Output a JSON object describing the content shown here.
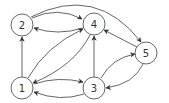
{
  "diagram": {
    "type": "directed-graph",
    "nodes": [
      {
        "id": "1",
        "label": "1",
        "x": 22,
        "y": 88
      },
      {
        "id": "2",
        "label": "2",
        "x": 22,
        "y": 25
      },
      {
        "id": "3",
        "label": "3",
        "x": 94,
        "y": 88
      },
      {
        "id": "4",
        "label": "4",
        "x": 94,
        "y": 24
      },
      {
        "id": "5",
        "label": "5",
        "x": 146,
        "y": 53
      }
    ],
    "edges": [
      {
        "from": "1",
        "to": "2"
      },
      {
        "from": "2",
        "to": "4"
      },
      {
        "from": "4",
        "to": "2"
      },
      {
        "from": "2",
        "to": "5"
      },
      {
        "from": "1",
        "to": "4"
      },
      {
        "from": "4",
        "to": "1"
      },
      {
        "from": "3",
        "to": "4"
      },
      {
        "from": "5",
        "to": "4"
      },
      {
        "from": "3",
        "to": "5"
      },
      {
        "from": "5",
        "to": "3"
      },
      {
        "from": "1",
        "to": "3"
      },
      {
        "from": "3",
        "to": "1"
      }
    ]
  }
}
